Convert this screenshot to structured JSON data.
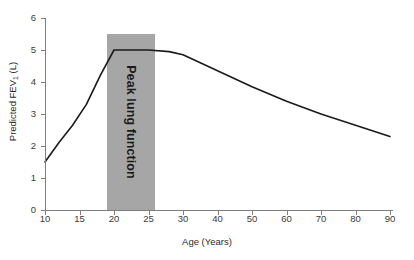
{
  "chart_data": {
    "type": "line",
    "title": "",
    "xlabel": "Age (Years)",
    "ylabel": "Predicted FEV",
    "ylabel_sub": "1",
    "ylabel_unit": " (L)",
    "xlim": [
      10,
      90
    ],
    "ylim": [
      0,
      6
    ],
    "grid": false,
    "legend": "none",
    "xticks": [
      10,
      15,
      20,
      25,
      30,
      40,
      50,
      60,
      70,
      80,
      90
    ],
    "xtick_labels": [
      "10",
      "15",
      "20",
      "25",
      "30",
      "40",
      "50",
      "60",
      "70",
      "80",
      "90"
    ],
    "yticks": [
      0,
      1,
      2,
      3,
      4,
      5,
      6
    ],
    "ytick_labels": [
      "0",
      "1",
      "2",
      "3",
      "4",
      "5",
      "6"
    ],
    "series": [
      {
        "name": "Predicted FEV1",
        "color": "#1a1a1a",
        "x": [
          10,
          12,
          14,
          16,
          18,
          20,
          22,
          25,
          28,
          30,
          35,
          40,
          50,
          60,
          70,
          80,
          90
        ],
        "values": [
          1.5,
          2.1,
          2.65,
          3.3,
          4.2,
          5.0,
          5.0,
          5.0,
          4.95,
          4.85,
          4.6,
          4.35,
          3.85,
          3.4,
          3.0,
          2.65,
          2.3
        ]
      }
    ],
    "annotations": [
      {
        "name": "peak-lung-function-band",
        "label": "Peak lung function",
        "type": "vertical-band",
        "x_start": 19,
        "x_end": 26,
        "y_top": 5.5,
        "y_bottom": 0,
        "color": "#a6a6a6",
        "text_color": "#1a1a1a",
        "orientation": "vertical"
      }
    ],
    "axis_color": "#7f7f7f",
    "background": "#ffffff"
  }
}
